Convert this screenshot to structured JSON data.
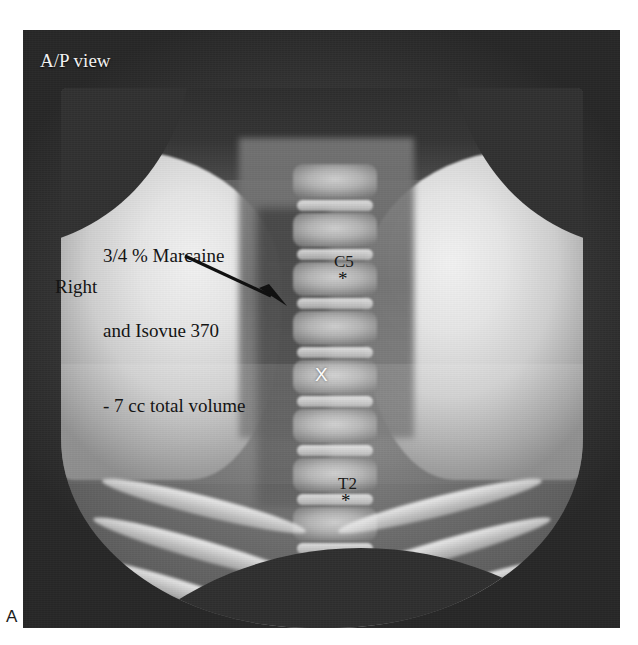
{
  "figure": {
    "panel_label": "A"
  },
  "radiograph": {
    "view_label": "A/P view",
    "side_label": "Right",
    "injectate_lines": [
      "3/4 % Marcaine",
      "and Isovue 370",
      "- 7 cc total volume"
    ],
    "vertebral_markers": [
      {
        "label": "C5",
        "symbol": "*"
      },
      {
        "label": "T2",
        "symbol": "*"
      }
    ],
    "needle_marker": "X",
    "colors": {
      "film_dark": "#2f2f2f",
      "soft_tissue": "#e6e6e6",
      "annotation_dark": "#141414",
      "annotation_light": "#f0f0f0",
      "page_background": "#ffffff"
    }
  }
}
